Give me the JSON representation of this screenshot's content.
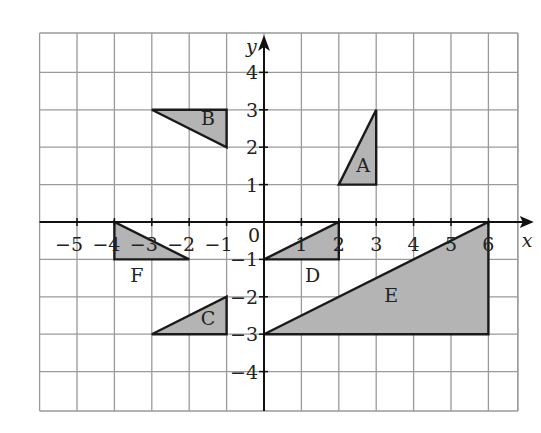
{
  "diagram": {
    "title": "",
    "grid": {
      "x_min": -6,
      "x_max": 7,
      "y_min": -5,
      "y_max": 5,
      "cell_px": 37.4,
      "origin_px": [
        264,
        222
      ],
      "color": "#9a9a9a"
    },
    "axes": {
      "x_label": "x",
      "y_label": "y",
      "origin_label": "0",
      "x_ticks": [
        {
          "v": -5,
          "label": "−5"
        },
        {
          "v": -4,
          "label": "−4"
        },
        {
          "v": -3,
          "label": "−3"
        },
        {
          "v": -2,
          "label": "−2"
        },
        {
          "v": -1,
          "label": "−1"
        },
        {
          "v": 1,
          "label": "1"
        },
        {
          "v": 2,
          "label": "2"
        },
        {
          "v": 3,
          "label": "3"
        },
        {
          "v": 4,
          "label": "4"
        },
        {
          "v": 5,
          "label": "5"
        },
        {
          "v": 6,
          "label": "6"
        }
      ],
      "y_ticks": [
        {
          "v": 4,
          "label": "4"
        },
        {
          "v": 3,
          "label": "3"
        },
        {
          "v": 2,
          "label": "2"
        },
        {
          "v": 1,
          "label": "1"
        },
        {
          "v": -1,
          "label": "−1"
        },
        {
          "v": -2,
          "label": "−2"
        },
        {
          "v": -3,
          "label": "−3"
        },
        {
          "v": -4,
          "label": "−4"
        }
      ]
    },
    "shapes": [
      {
        "name": "A",
        "vertices": [
          [
            2,
            1
          ],
          [
            3,
            1
          ],
          [
            3,
            3
          ]
        ],
        "label_pos": [
          2.65,
          1.35
        ]
      },
      {
        "name": "B",
        "vertices": [
          [
            -3,
            3
          ],
          [
            -1,
            3
          ],
          [
            -1,
            2
          ]
        ],
        "label_pos": [
          -1.5,
          2.6
        ]
      },
      {
        "name": "C",
        "vertices": [
          [
            -3,
            -3
          ],
          [
            -1,
            -3
          ],
          [
            -1,
            -2
          ]
        ],
        "label_pos": [
          -1.5,
          -2.75
        ]
      },
      {
        "name": "D",
        "vertices": [
          [
            0,
            -1
          ],
          [
            2,
            -1
          ],
          [
            2,
            0
          ]
        ],
        "label_pos": [
          1.3,
          -1.6
        ]
      },
      {
        "name": "E",
        "vertices": [
          [
            0,
            -3
          ],
          [
            6,
            -3
          ],
          [
            6,
            0
          ]
        ],
        "label_pos": [
          3.4,
          -2.15
        ]
      },
      {
        "name": "F",
        "vertices": [
          [
            -4,
            0
          ],
          [
            -4,
            -1
          ],
          [
            -2,
            -1
          ]
        ],
        "label_pos": [
          -3.4,
          -1.6
        ]
      }
    ],
    "fill_color": "#b4b4b4",
    "stroke_color": "#1a1a1a"
  }
}
